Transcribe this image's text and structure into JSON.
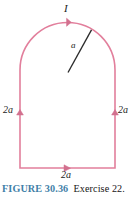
{
  "figure": {
    "caption": {
      "figure_number": "FIGURE 30.36",
      "exercise_text": "Exercise 22."
    },
    "labels": {
      "current": "I",
      "radius": "a",
      "left_side": "2a",
      "right_side": "2a",
      "bottom_side": "2a"
    },
    "colors": {
      "wire": "#e27f9c",
      "wire_dark": "#d2708e",
      "radius_line": "#2b2b2b",
      "caption_blue": "#3f7fa8",
      "caption_black": "#161616",
      "background": "#ffffff"
    },
    "geometry": {
      "shape": "semicircle-topped rectangle current loop",
      "left_x": 20,
      "right_x": 115,
      "bottom_y": 168,
      "arc_center_x": 67.5,
      "arc_center_y": 70,
      "arc_radius": 47.5,
      "apex_y": 22,
      "radius_line_start": [
        68,
        72
      ],
      "radius_line_end": [
        91,
        30
      ]
    },
    "arrows": {
      "top_arc_direction": "clockwise-at-apex",
      "left_side_direction": "up",
      "right_side_direction": "up",
      "bottom_side_direction": "right"
    }
  }
}
